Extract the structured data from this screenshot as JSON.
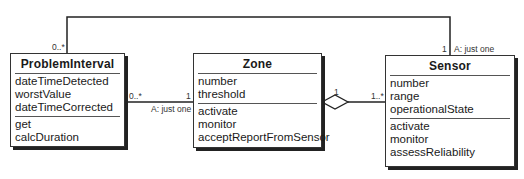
{
  "classes": {
    "problem_interval": {
      "name": "ProblemInterval",
      "attributes": [
        "dateTimeDetected",
        "worstValue",
        "dateTimeCorrected"
      ],
      "operations": [
        "get",
        "calcDuration"
      ]
    },
    "zone": {
      "name": "Zone",
      "attributes": [
        "number",
        "threshold"
      ],
      "operations": [
        "activate",
        "monitor",
        "acceptReportFromSensor"
      ]
    },
    "sensor": {
      "name": "Sensor",
      "attributes": [
        "number",
        "range",
        "operationalState"
      ],
      "operations": [
        "activate",
        "monitor",
        "assessReliability"
      ]
    }
  },
  "associations": {
    "pi_sensor": {
      "pi_mult": "0..*",
      "sensor_mult": "1",
      "sensor_qualifier": "A: just one"
    },
    "pi_zone": {
      "pi_mult": "0..*",
      "zone_mult": "1",
      "zone_qualifier": "A: just one"
    },
    "zone_sensor": {
      "zone_mult": "1",
      "sensor_mult": "1..*",
      "type": "aggregation"
    }
  }
}
